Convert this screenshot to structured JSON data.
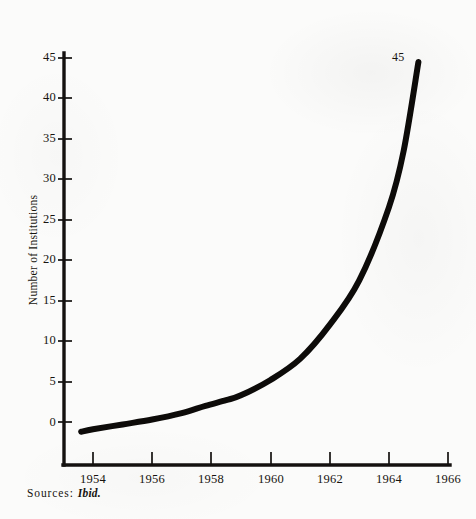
{
  "figure": {
    "source_note_prefix": "Sources:",
    "source_note_reference": "Ibid.",
    "endpoint_label": "45",
    "background_color": "#fbfbfa",
    "ink_color": "#14110f"
  },
  "chart_data": {
    "type": "line",
    "title": "",
    "subtitle": "",
    "xlabel": "",
    "ylabel": "Number of Institutions",
    "xlim": [
      1953.1,
      1966.3
    ],
    "ylim": [
      -2.5,
      46.5
    ],
    "xticks": [
      1954,
      1956,
      1958,
      1960,
      1962,
      1964,
      1966
    ],
    "xtick_labels": [
      "1954",
      "1956",
      "1958",
      "1960",
      "1962",
      "1964",
      "1966"
    ],
    "yticks": [
      0,
      5,
      10,
      15,
      20,
      25,
      30,
      35,
      40,
      45
    ],
    "ytick_labels": [
      "0",
      "5",
      "10",
      "15",
      "20",
      "25",
      "30",
      "35",
      "40",
      "45"
    ],
    "grid": false,
    "legend": false,
    "legend_position": "none",
    "annotations": [
      {
        "text": "45",
        "x": 1964.8,
        "y": 45.0,
        "note": "value label at end of curve"
      }
    ],
    "series": [
      {
        "name": "Number of Institutions",
        "color": "#0d0b09",
        "line_width": 6,
        "x": [
          1953.6,
          1954.0,
          1955.0,
          1956.0,
          1957.0,
          1957.8,
          1958.5,
          1959.0,
          1960.0,
          1961.0,
          1962.0,
          1963.0,
          1964.0,
          1964.5,
          1965.0
        ],
        "values": [
          -1.2,
          -0.9,
          -0.3,
          0.3,
          1.1,
          2.0,
          2.7,
          3.3,
          5.2,
          7.8,
          12.0,
          17.5,
          26.5,
          33.5,
          44.5
        ]
      }
    ]
  },
  "axes": {
    "y_axis_name": "y-axis",
    "x_axis_name": "x-axis"
  }
}
